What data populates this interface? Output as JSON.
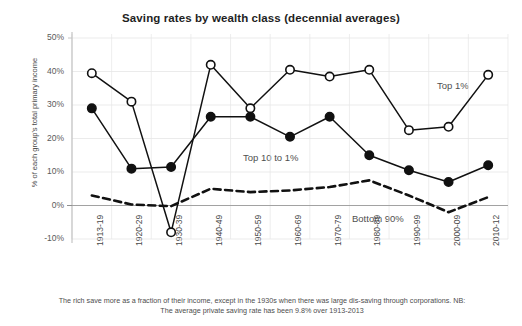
{
  "chart_data": {
    "type": "line",
    "title": "Saving rates by wealth class (decennial averages)",
    "xlabel": "",
    "ylabel": "% of each group's total primary income",
    "ylim": [
      -10,
      50
    ],
    "ytick_labels": [
      "50%",
      "40%",
      "30%",
      "20%",
      "10%",
      "0%",
      "-10%"
    ],
    "yticks": [
      50,
      40,
      30,
      20,
      10,
      0,
      -10
    ],
    "grid": true,
    "legend_position": "inline-annotations",
    "categories": [
      "1913-19",
      "1920-29",
      "1930-39",
      "1940-49",
      "1950-59",
      "1960-69",
      "1970-79",
      "1980-89",
      "1990-99",
      "2000-09",
      "2010-12"
    ],
    "series": [
      {
        "name": "Top 1%",
        "marker": "open-circle",
        "line": "solid",
        "color": "#111111",
        "values": [
          39.5,
          31,
          -8,
          42,
          29,
          40.5,
          38.5,
          40.5,
          22.5,
          23.5,
          39
        ]
      },
      {
        "name": "Top 10 to 1%",
        "marker": "filled-circle",
        "line": "solid",
        "color": "#111111",
        "values": [
          29,
          11,
          11.5,
          26.5,
          26.5,
          20.5,
          26.5,
          15,
          10.5,
          7,
          12
        ]
      },
      {
        "name": "Bottom 90%",
        "marker": "none",
        "line": "dashed",
        "color": "#111111",
        "values": [
          3,
          0.3,
          -0.2,
          5,
          4,
          4.5,
          5.5,
          7.5,
          3,
          -2,
          2.5
        ]
      }
    ],
    "annotations": [
      {
        "text": "Top 1%",
        "x": 437,
        "y": 80
      },
      {
        "text": "Top 10 to 1%",
        "x": 243,
        "y": 152
      },
      {
        "text": "Bottom 90%",
        "x": 352,
        "y": 213
      }
    ],
    "footnote": "The rich save more as a fraction of their income, except in the 1930s when there was large dis-saving through corporations. NB: The average private saving rate has been 9.8% over 1913-2013"
  }
}
